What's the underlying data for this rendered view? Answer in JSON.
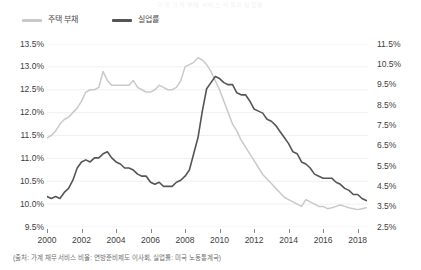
{
  "title": "미국 가계 부채 서비스 비율과 실업률",
  "footnote": "(출처: 가계 채무 서비스 비율: 연방준비제도 이사회, 실업률: 미국 노동통계국)",
  "legend": {
    "items": [
      {
        "label": "주택 부채",
        "color": "#c9c9c9"
      },
      {
        "label": "실업률",
        "color": "#555555"
      }
    ]
  },
  "axis": {
    "left_ticks": [
      "13.5%",
      "13.0%",
      "12.5%",
      "12.0%",
      "11.5%",
      "11.0%",
      "10.5%",
      "10.0%",
      "9.5%"
    ],
    "right_ticks": [
      "11.5%",
      "10.5%",
      "9.5%",
      "8.5%",
      "7.5%",
      "6.5%",
      "5.5%",
      "4.5%",
      "3.5%",
      "2.5%"
    ],
    "x_ticks": [
      "2000",
      "2002",
      "2004",
      "2006",
      "2008",
      "2010",
      "2012",
      "2014",
      "2016",
      "2018"
    ]
  },
  "chart_data": {
    "type": "line",
    "title": "미국 가계 부채 서비스 비율과 실업률",
    "xlabel": "",
    "ylabel": "주택 부채 (%)",
    "y2label": "실업률 (%)",
    "grid": true,
    "legend_position": "top-left",
    "xlim": [
      2000,
      2018.6
    ],
    "ylim": [
      9.5,
      13.5
    ],
    "y2lim": [
      2.5,
      11.5
    ],
    "xticks": [
      2000,
      2002,
      2004,
      2006,
      2008,
      2010,
      2012,
      2014,
      2016,
      2018
    ],
    "yticks": [
      9.5,
      10.0,
      10.5,
      11.0,
      11.5,
      12.0,
      12.5,
      13.0,
      13.5
    ],
    "y2ticks": [
      2.5,
      3.5,
      4.5,
      5.5,
      6.5,
      7.5,
      8.5,
      9.5,
      10.5,
      11.5
    ],
    "series": [
      {
        "name": "주택 부채",
        "color": "#c9c9c9",
        "axis": "left",
        "x": [
          2000.0,
          2000.25,
          2000.5,
          2000.75,
          2001.0,
          2001.25,
          2001.5,
          2001.75,
          2002.0,
          2002.25,
          2002.5,
          2002.75,
          2003.0,
          2003.25,
          2003.5,
          2003.75,
          2004.0,
          2004.25,
          2004.5,
          2004.75,
          2005.0,
          2005.25,
          2005.5,
          2005.75,
          2006.0,
          2006.25,
          2006.5,
          2006.75,
          2007.0,
          2007.25,
          2007.5,
          2007.75,
          2008.0,
          2008.25,
          2008.5,
          2008.75,
          2009.0,
          2009.25,
          2009.5,
          2009.75,
          2010.0,
          2010.25,
          2010.5,
          2010.75,
          2011.0,
          2011.25,
          2011.5,
          2011.75,
          2012.0,
          2012.25,
          2012.5,
          2012.75,
          2013.0,
          2013.25,
          2013.5,
          2013.75,
          2014.0,
          2014.25,
          2014.5,
          2014.75,
          2015.0,
          2015.25,
          2015.5,
          2015.75,
          2016.0,
          2016.25,
          2016.5,
          2016.75,
          2017.0,
          2017.25,
          2017.5,
          2017.75,
          2018.0,
          2018.25,
          2018.5
        ],
        "values": [
          11.45,
          11.5,
          11.6,
          11.75,
          11.85,
          11.9,
          12.0,
          12.1,
          12.25,
          12.45,
          12.5,
          12.5,
          12.55,
          12.9,
          12.7,
          12.6,
          12.6,
          12.6,
          12.6,
          12.6,
          12.7,
          12.55,
          12.5,
          12.45,
          12.45,
          12.5,
          12.6,
          12.55,
          12.5,
          12.5,
          12.55,
          12.7,
          13.0,
          13.05,
          13.1,
          13.2,
          13.15,
          13.05,
          12.9,
          12.7,
          12.5,
          12.25,
          12.0,
          11.75,
          11.6,
          11.4,
          11.25,
          11.1,
          10.95,
          10.8,
          10.65,
          10.55,
          10.45,
          10.35,
          10.25,
          10.15,
          10.1,
          10.05,
          10.0,
          9.95,
          10.1,
          10.05,
          10.0,
          9.95,
          9.95,
          9.9,
          9.92,
          9.95,
          9.98,
          9.95,
          9.92,
          9.9,
          9.88,
          9.9,
          9.92
        ]
      },
      {
        "name": "실업률",
        "color": "#555555",
        "axis": "right",
        "x": [
          2000.0,
          2000.25,
          2000.5,
          2000.75,
          2001.0,
          2001.25,
          2001.5,
          2001.75,
          2002.0,
          2002.25,
          2002.5,
          2002.75,
          2003.0,
          2003.25,
          2003.5,
          2003.75,
          2004.0,
          2004.25,
          2004.5,
          2004.75,
          2005.0,
          2005.25,
          2005.5,
          2005.75,
          2006.0,
          2006.25,
          2006.5,
          2006.75,
          2007.0,
          2007.25,
          2007.5,
          2007.75,
          2008.0,
          2008.25,
          2008.5,
          2008.75,
          2009.0,
          2009.25,
          2009.5,
          2009.75,
          2010.0,
          2010.25,
          2010.5,
          2010.75,
          2011.0,
          2011.25,
          2011.5,
          2011.75,
          2012.0,
          2012.25,
          2012.5,
          2012.75,
          2013.0,
          2013.25,
          2013.5,
          2013.75,
          2014.0,
          2014.25,
          2014.5,
          2014.75,
          2015.0,
          2015.25,
          2015.5,
          2015.75,
          2016.0,
          2016.25,
          2016.5,
          2016.75,
          2017.0,
          2017.25,
          2017.5,
          2017.75,
          2018.0,
          2018.25,
          2018.5
        ],
        "values": [
          4.0,
          3.9,
          4.0,
          3.9,
          4.2,
          4.4,
          4.8,
          5.4,
          5.7,
          5.8,
          5.7,
          5.9,
          5.9,
          6.1,
          6.2,
          5.9,
          5.7,
          5.6,
          5.4,
          5.4,
          5.3,
          5.1,
          5.0,
          5.0,
          4.7,
          4.6,
          4.7,
          4.5,
          4.5,
          4.5,
          4.7,
          4.8,
          5.0,
          5.3,
          6.1,
          6.9,
          8.2,
          9.3,
          9.6,
          9.9,
          9.8,
          9.6,
          9.5,
          9.5,
          9.1,
          9.0,
          9.0,
          8.7,
          8.3,
          8.2,
          8.1,
          7.8,
          7.7,
          7.5,
          7.2,
          6.9,
          6.6,
          6.2,
          6.1,
          5.7,
          5.6,
          5.4,
          5.1,
          5.0,
          4.9,
          4.9,
          4.9,
          4.7,
          4.6,
          4.4,
          4.3,
          4.1,
          4.1,
          3.9,
          3.8
        ]
      }
    ]
  }
}
